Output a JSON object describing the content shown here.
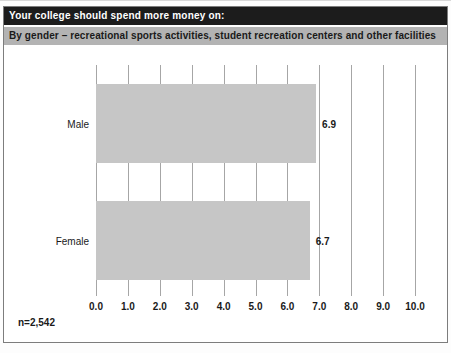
{
  "header": {
    "title": "Your college should spend more money on:",
    "subtitle": "By gender – recreational sports activities, student recreation centers and other facilities"
  },
  "footnote": "n=2,542",
  "colors": {
    "title_bar_bg": "#1c1c1c",
    "title_text": "#ffffff",
    "subtitle_bar_bg": "#b3b3b3",
    "bar_fill": "#c6c6c6",
    "gridline": "#a6a6a6",
    "text": "#1a1a1a",
    "frame_border": "#7d7d7d"
  },
  "chart_data": {
    "type": "bar",
    "orientation": "horizontal",
    "title": "Your college should spend more money on:",
    "subtitle": "By gender – recreational sports activities, student recreation centers and other facilities",
    "categories": [
      "Male",
      "Female"
    ],
    "values": [
      6.9,
      6.7
    ],
    "value_labels": [
      "6.9",
      "6.7"
    ],
    "xlabel": "",
    "ylabel": "",
    "xlim": [
      0.0,
      10.0
    ],
    "xtick_step": 1.0,
    "xticks": [
      "0.0",
      "1.0",
      "2.0",
      "3.0",
      "4.0",
      "5.0",
      "6.0",
      "7.0",
      "8.0",
      "9.0",
      "10.0"
    ],
    "grid": true,
    "legend": false,
    "sample_size": "n=2,542"
  }
}
